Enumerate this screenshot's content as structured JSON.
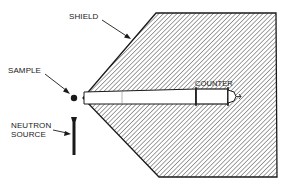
{
  "diagram": {
    "labels": {
      "shield": "SHIELD",
      "sample": "SAMPLE",
      "counter": "COUNTER",
      "neutron_source_line1": "NEUTRON",
      "neutron_source_line2": "SOURCE"
    },
    "colors": {
      "ink": "#1a1a1a",
      "hatch": "#555555",
      "background": "#ffffff"
    }
  }
}
